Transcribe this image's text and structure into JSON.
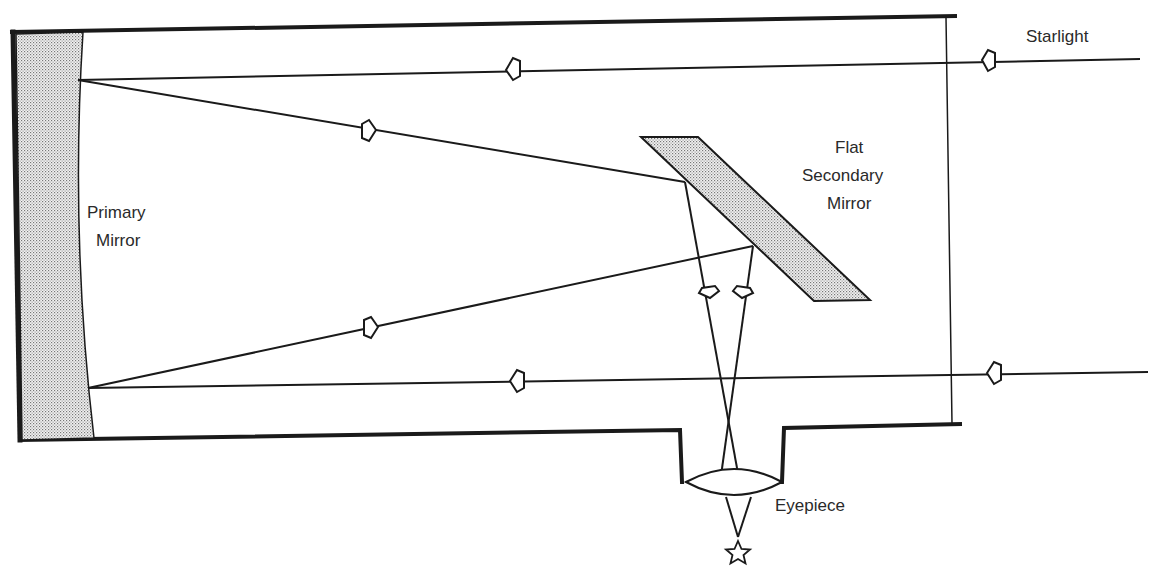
{
  "diagram": {
    "type": "newtonian-reflector-telescope",
    "labels": {
      "starlight": "Starlight",
      "primary_mirror_line1": "Primary",
      "primary_mirror_line2": "Mirror",
      "secondary_line1": "Flat",
      "secondary_line2": "Secondary",
      "secondary_line3": "Mirror",
      "eyepiece": "Eyepiece"
    },
    "colors": {
      "line": "#1a1a1a",
      "mirror_fill": "#d9d9d9",
      "text": "#2a2a2a"
    },
    "components": [
      {
        "name": "Primary Mirror",
        "kind": "concave mirror"
      },
      {
        "name": "Flat Secondary Mirror",
        "kind": "flat diagonal mirror"
      },
      {
        "name": "Eyepiece",
        "kind": "convex lens"
      },
      {
        "name": "Focal point",
        "kind": "star symbol"
      }
    ]
  }
}
